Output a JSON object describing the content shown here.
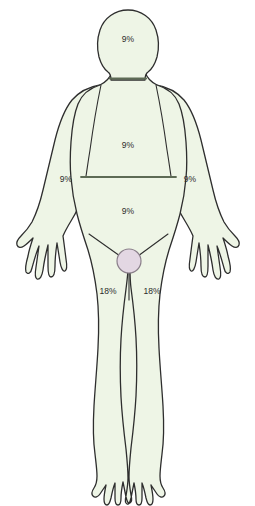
{
  "diagram": {
    "figure_name": "anterior-human-body-outline",
    "colors": {
      "body_fill": "#eef5e6",
      "outline": "#2e2e2e",
      "divider": "#5d6b55",
      "groin_marker_fill": "#e3d7e3",
      "groin_marker_stroke": "#8a7f8a",
      "label_text": "#2b2b2b",
      "background": "#ffffff"
    },
    "regions": [
      {
        "id": "head",
        "name": "head-and-neck",
        "label": "9%",
        "x": 128,
        "y": 40
      },
      {
        "id": "chest",
        "name": "upper-torso",
        "label": "9%",
        "x": 128,
        "y": 146
      },
      {
        "id": "abdomen",
        "name": "lower-torso",
        "label": "9%",
        "x": 128,
        "y": 212
      },
      {
        "id": "arm-left",
        "name": "left-arm",
        "label": "9%",
        "x": 66,
        "y": 180
      },
      {
        "id": "arm-right",
        "name": "right-arm",
        "label": "9%",
        "x": 190,
        "y": 180
      },
      {
        "id": "leg-left",
        "name": "left-leg",
        "label": "18%",
        "x": 108,
        "y": 292
      },
      {
        "id": "leg-right",
        "name": "right-leg",
        "label": "18%",
        "x": 152,
        "y": 292
      }
    ],
    "markers": [
      {
        "id": "groin",
        "name": "perineum-marker",
        "cx": 129,
        "cy": 261,
        "r": 12
      }
    ]
  }
}
